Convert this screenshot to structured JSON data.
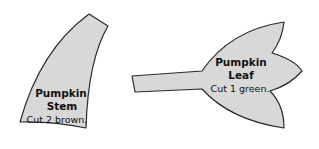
{
  "pieces": [
    {
      "name": "Pumpkin Stem",
      "title_line1": "Pumpkin",
      "title_line2": "Stem",
      "instruction": "Cut 2 brown."
    },
    {
      "name": "Pumpkin Leaf",
      "title_line1": "Pumpkin",
      "title_line2": "Leaf",
      "instruction": "Cut 1 green."
    }
  ],
  "colors": {
    "fill": "#d8d8d8",
    "outline": "#2a2a2a",
    "text": "#111111"
  }
}
